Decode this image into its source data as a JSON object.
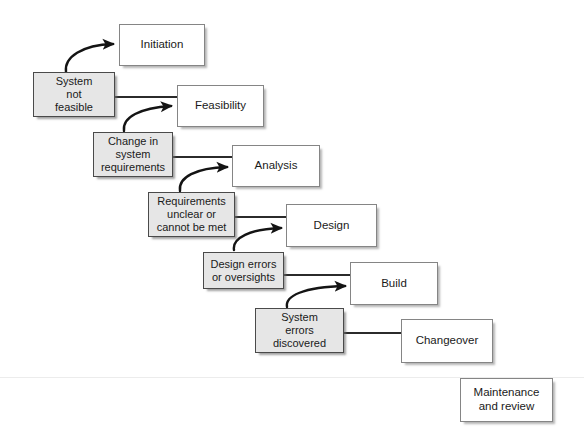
{
  "diagram": {
    "canvas": {
      "width": 584,
      "height": 436,
      "background": "#ffffff"
    },
    "colors": {
      "stage_fill": "#ffffff",
      "stage_border": "#858585",
      "feedback_fill": "#e6e6e6",
      "feedback_border": "#4a4a4a",
      "connector": "#2b2b2b",
      "arrow": "#141414",
      "text": "#1a1a1a"
    },
    "stages": [
      {
        "id": "initiation",
        "label": "Initiation",
        "x": 119,
        "y": 24,
        "w": 86,
        "h": 42
      },
      {
        "id": "feasibility",
        "label": "Feasibility",
        "x": 177,
        "y": 85,
        "w": 87,
        "h": 42
      },
      {
        "id": "analysis",
        "label": "Analysis",
        "x": 232,
        "y": 145,
        "w": 88,
        "h": 42
      },
      {
        "id": "design",
        "label": "Design",
        "x": 286,
        "y": 204,
        "w": 91,
        "h": 43
      },
      {
        "id": "build",
        "label": "Build",
        "x": 350,
        "y": 262,
        "w": 88,
        "h": 43
      },
      {
        "id": "changeover",
        "label": "Changeover",
        "x": 401,
        "y": 319,
        "w": 92,
        "h": 44
      },
      {
        "id": "maintenance",
        "label": "Maintenance\nand review",
        "x": 460,
        "y": 378,
        "w": 93,
        "h": 44
      }
    ],
    "feedbacks": [
      {
        "id": "system-not-feasible",
        "label": "System\nnot\nfeasible",
        "x": 33,
        "y": 72,
        "w": 82,
        "h": 45
      },
      {
        "id": "change-in-requirements",
        "label": "Change in\nsystem\nrequirements",
        "x": 93,
        "y": 132,
        "w": 80,
        "h": 45
      },
      {
        "id": "requirements-unclear",
        "label": "Requirements\nunclear or\ncannot be met",
        "x": 148,
        "y": 192,
        "w": 87,
        "h": 45
      },
      {
        "id": "design-errors",
        "label": "Design errors\nor oversights",
        "x": 203,
        "y": 252,
        "w": 81,
        "h": 37
      },
      {
        "id": "system-errors",
        "label": "System\nerrors\ndiscovered",
        "x": 255,
        "y": 308,
        "w": 89,
        "h": 45
      }
    ],
    "connectors": [
      {
        "id": "line-snf-to-feasibility",
        "from": "system-not-feasible",
        "to": "feasibility",
        "path": "M115 97 L177 97"
      },
      {
        "id": "line-chg-to-analysis",
        "from": "change-in-requirements",
        "to": "analysis",
        "path": "M173 157 L232 157"
      },
      {
        "id": "line-req-to-design",
        "from": "requirements-unclear",
        "to": "design",
        "path": "M235 217 L286 217"
      },
      {
        "id": "line-des-to-build",
        "from": "design-errors",
        "to": "build",
        "path": "M284 275 L350 275"
      },
      {
        "id": "line-sys-to-changeover",
        "from": "system-errors",
        "to": "changeover",
        "path": "M344 333 L401 333"
      }
    ],
    "arrows": [
      {
        "id": "arrow-snf-to-initiation",
        "from": "system-not-feasible",
        "to": "initiation",
        "path": "M66 72 C64 57, 82 45, 115 44"
      },
      {
        "id": "arrow-chg-to-feasibility",
        "from": "change-in-requirements",
        "to": "feasibility",
        "path": "M124 131 C122 117, 140 108, 172 106"
      },
      {
        "id": "arrow-req-to-analysis",
        "from": "requirements-unclear",
        "to": "analysis",
        "path": "M180 191 C178 177, 196 168, 228 167"
      },
      {
        "id": "arrow-des-to-design",
        "from": "design-errors",
        "to": "design",
        "path": "M234 250 C232 238, 250 229, 282 228"
      },
      {
        "id": "arrow-sys-to-build",
        "from": "system-errors",
        "to": "build",
        "path": "M287 307 C285 296, 303 287, 346 286"
      }
    ],
    "artifacts": [
      {
        "id": "scanline",
        "y": 377
      }
    ]
  }
}
